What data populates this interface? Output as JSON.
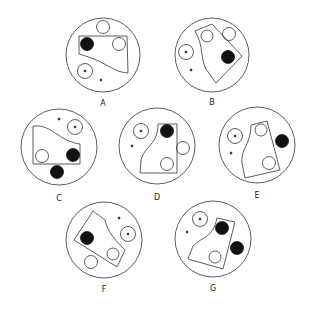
{
  "figures": [
    {
      "label": "A"
    },
    {
      "label": "B"
    },
    {
      "label": "C"
    },
    {
      "label": "D"
    },
    {
      "label": "E"
    },
    {
      "label": "F"
    },
    {
      "label": "G"
    }
  ],
  "colors": {
    "stroke": "#333333",
    "fill_dark": "#111111",
    "background": "#ffffff"
  }
}
